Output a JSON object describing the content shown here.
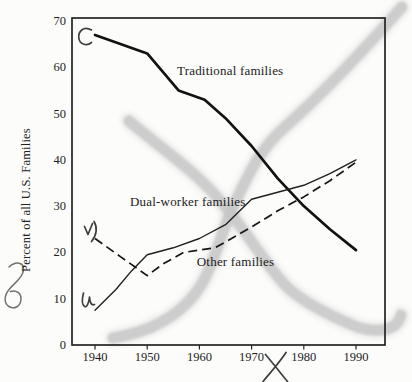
{
  "figure": {
    "background_color": "#fcfcfa",
    "ink_color": "#1a1a1a",
    "highlighter_color": "#c6c6c6",
    "annotation_ink_color": "#3e3e3e"
  },
  "chart_data": {
    "type": "line",
    "title": "",
    "xlabel": "",
    "ylabel": "Percent of all U.S. Families",
    "xlim": [
      1935.6,
      1995.6
    ],
    "ylim": [
      0,
      70.7
    ],
    "x_ticks": [
      1940,
      1950,
      1960,
      1970,
      1980,
      1990
    ],
    "y_ticks": [
      0,
      10,
      20,
      30,
      40,
      50,
      60,
      70
    ],
    "grid": false,
    "legend": "inline-labels",
    "series": [
      {
        "name": "Traditional families",
        "line_style": "solid-thick",
        "points": [
          [
            1940,
            67
          ],
          [
            1950,
            63
          ],
          [
            1956,
            55
          ],
          [
            1961,
            53
          ],
          [
            1965,
            49
          ],
          [
            1970,
            43
          ],
          [
            1975,
            36
          ],
          [
            1980,
            30
          ],
          [
            1985,
            25
          ],
          [
            1990,
            20.5
          ]
        ],
        "label_anchor": {
          "year": 1955.7,
          "value": 59.2
        }
      },
      {
        "name": "Dual-worker families",
        "line_style": "solid-thin",
        "points": [
          [
            1940,
            7.5
          ],
          [
            1944,
            12
          ],
          [
            1947,
            16
          ],
          [
            1950,
            19.5
          ],
          [
            1955,
            21
          ],
          [
            1960,
            23
          ],
          [
            1965,
            26
          ],
          [
            1970,
            31.5
          ],
          [
            1975,
            33
          ],
          [
            1980,
            34.5
          ],
          [
            1985,
            37
          ],
          [
            1990,
            40
          ]
        ],
        "label_anchor": {
          "year": 1946.7,
          "value": 31
        }
      },
      {
        "name": "Other families",
        "line_style": "dashed",
        "points": [
          [
            1940,
            23
          ],
          [
            1945,
            19
          ],
          [
            1950,
            15
          ],
          [
            1953,
            17.5
          ],
          [
            1957,
            20
          ],
          [
            1963,
            21
          ],
          [
            1970,
            25.5
          ],
          [
            1975,
            29
          ],
          [
            1980,
            32
          ],
          [
            1985,
            35.5
          ],
          [
            1990,
            39.5
          ]
        ],
        "label_anchor": {
          "year": 1959.5,
          "value": 17.9
        }
      }
    ],
    "handwritten_annotations": [
      {
        "glyph": "C",
        "location": "inside plot, top left, beside start of Traditional families line"
      },
      {
        "glyph": "v)",
        "location": "inside plot, left, above start of Other families dashed line"
      },
      {
        "glyph": "u",
        "location": "inside plot, left, beside start of Dual-worker families line"
      },
      {
        "glyph": "y",
        "location": "left margin, below the y-axis label"
      },
      {
        "glyph": "X",
        "location": "below the x-axis, near 1975"
      },
      {
        "glyph": "highlighter cross",
        "location": "two broad gray marker strokes crossing the plot corner to corner"
      }
    ]
  }
}
